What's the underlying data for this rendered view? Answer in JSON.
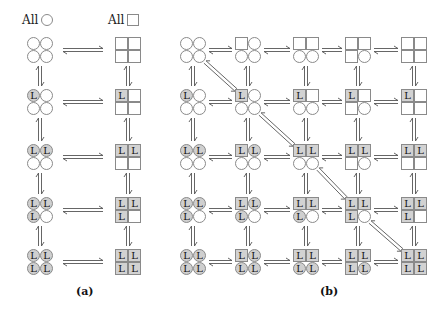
{
  "headers": {
    "circle": {
      "text": "All",
      "shape": "circle"
    },
    "square": {
      "text": "All",
      "shape": "square"
    }
  },
  "labels": {
    "a": "(a)",
    "b": "(b)"
  },
  "colors": {
    "stroke": "#8a8a8a",
    "filled": "#cfcfcf",
    "arrow": "#555555"
  },
  "panel_a": {
    "columns_x": [
      40,
      128
    ],
    "rows_y": [
      50,
      102,
      157,
      210,
      262
    ],
    "nodes": [
      {
        "col": 0,
        "row": 0,
        "cells": [
          [
            "c",
            ""
          ],
          [
            "c",
            ""
          ],
          [
            "c",
            ""
          ],
          [
            "c",
            ""
          ]
        ]
      },
      {
        "col": 0,
        "row": 1,
        "cells": [
          [
            "c",
            "L"
          ],
          [
            "c",
            ""
          ],
          [
            "c",
            ""
          ],
          [
            "c",
            ""
          ]
        ]
      },
      {
        "col": 0,
        "row": 2,
        "cells": [
          [
            "c",
            "L"
          ],
          [
            "c",
            "L"
          ],
          [
            "c",
            ""
          ],
          [
            "c",
            ""
          ]
        ]
      },
      {
        "col": 0,
        "row": 3,
        "cells": [
          [
            "c",
            "L"
          ],
          [
            "c",
            "L"
          ],
          [
            "c",
            "L"
          ],
          [
            "c",
            ""
          ]
        ]
      },
      {
        "col": 0,
        "row": 4,
        "cells": [
          [
            "c",
            "L"
          ],
          [
            "c",
            "L"
          ],
          [
            "c",
            "L"
          ],
          [
            "c",
            "L"
          ]
        ]
      },
      {
        "col": 1,
        "row": 0,
        "cells": [
          [
            "s",
            ""
          ],
          [
            "s",
            ""
          ],
          [
            "s",
            ""
          ],
          [
            "s",
            ""
          ]
        ]
      },
      {
        "col": 1,
        "row": 1,
        "cells": [
          [
            "s",
            "L"
          ],
          [
            "s",
            ""
          ],
          [
            "s",
            ""
          ],
          [
            "s",
            ""
          ]
        ]
      },
      {
        "col": 1,
        "row": 2,
        "cells": [
          [
            "s",
            "L"
          ],
          [
            "s",
            "L"
          ],
          [
            "s",
            ""
          ],
          [
            "s",
            ""
          ]
        ]
      },
      {
        "col": 1,
        "row": 3,
        "cells": [
          [
            "s",
            "L"
          ],
          [
            "s",
            "L"
          ],
          [
            "s",
            "L"
          ],
          [
            "s",
            ""
          ]
        ]
      },
      {
        "col": 1,
        "row": 4,
        "cells": [
          [
            "s",
            "L"
          ],
          [
            "s",
            "L"
          ],
          [
            "s",
            "L"
          ],
          [
            "s",
            "L"
          ]
        ]
      }
    ]
  },
  "panel_b": {
    "columns_x": [
      193,
      248,
      306,
      358,
      414
    ],
    "rows_y": [
      50,
      102,
      157,
      210,
      262
    ],
    "diagonals": [
      [
        0,
        0,
        1,
        1
      ],
      [
        1,
        1,
        2,
        2
      ],
      [
        2,
        2,
        3,
        3
      ],
      [
        3,
        3,
        4,
        4
      ]
    ],
    "nodes_note": "cells order: top-left, top-right, bottom-left, bottom-right; c=circle s=square; L=ligand bound"
  },
  "grid_b": [
    [
      [
        [
          "c",
          ""
        ],
        [
          "c",
          ""
        ],
        [
          "c",
          ""
        ],
        [
          "c",
          ""
        ]
      ],
      [
        [
          "s",
          ""
        ],
        [
          "c",
          ""
        ],
        [
          "c",
          ""
        ],
        [
          "c",
          ""
        ]
      ],
      [
        [
          "s",
          ""
        ],
        [
          "s",
          ""
        ],
        [
          "c",
          ""
        ],
        [
          "c",
          ""
        ]
      ],
      [
        [
          "s",
          ""
        ],
        [
          "s",
          ""
        ],
        [
          "s",
          ""
        ],
        [
          "c",
          ""
        ]
      ],
      [
        [
          "s",
          ""
        ],
        [
          "s",
          ""
        ],
        [
          "s",
          ""
        ],
        [
          "s",
          ""
        ]
      ]
    ],
    [
      [
        [
          "c",
          "L"
        ],
        [
          "c",
          ""
        ],
        [
          "c",
          ""
        ],
        [
          "c",
          ""
        ]
      ],
      [
        [
          "s",
          "L"
        ],
        [
          "c",
          ""
        ],
        [
          "c",
          ""
        ],
        [
          "c",
          ""
        ]
      ],
      [
        [
          "s",
          "L"
        ],
        [
          "s",
          ""
        ],
        [
          "c",
          ""
        ],
        [
          "c",
          ""
        ]
      ],
      [
        [
          "s",
          "L"
        ],
        [
          "s",
          ""
        ],
        [
          "s",
          ""
        ],
        [
          "c",
          ""
        ]
      ],
      [
        [
          "s",
          "L"
        ],
        [
          "s",
          ""
        ],
        [
          "s",
          ""
        ],
        [
          "s",
          ""
        ]
      ]
    ],
    [
      [
        [
          "c",
          "L"
        ],
        [
          "c",
          "L"
        ],
        [
          "c",
          ""
        ],
        [
          "c",
          ""
        ]
      ],
      [
        [
          "s",
          "L"
        ],
        [
          "c",
          "L"
        ],
        [
          "c",
          ""
        ],
        [
          "c",
          ""
        ]
      ],
      [
        [
          "s",
          "L"
        ],
        [
          "s",
          "L"
        ],
        [
          "c",
          ""
        ],
        [
          "c",
          ""
        ]
      ],
      [
        [
          "s",
          "L"
        ],
        [
          "s",
          "L"
        ],
        [
          "s",
          ""
        ],
        [
          "c",
          ""
        ]
      ],
      [
        [
          "s",
          "L"
        ],
        [
          "s",
          "L"
        ],
        [
          "s",
          ""
        ],
        [
          "s",
          ""
        ]
      ]
    ],
    [
      [
        [
          "c",
          "L"
        ],
        [
          "c",
          "L"
        ],
        [
          "c",
          "L"
        ],
        [
          "c",
          ""
        ]
      ],
      [
        [
          "s",
          "L"
        ],
        [
          "c",
          "L"
        ],
        [
          "c",
          "L"
        ],
        [
          "c",
          ""
        ]
      ],
      [
        [
          "s",
          "L"
        ],
        [
          "s",
          "L"
        ],
        [
          "c",
          "L"
        ],
        [
          "c",
          ""
        ]
      ],
      [
        [
          "s",
          "L"
        ],
        [
          "s",
          "L"
        ],
        [
          "s",
          "L"
        ],
        [
          "c",
          ""
        ]
      ],
      [
        [
          "s",
          "L"
        ],
        [
          "s",
          "L"
        ],
        [
          "s",
          "L"
        ],
        [
          "s",
          ""
        ]
      ]
    ],
    [
      [
        [
          "c",
          "L"
        ],
        [
          "c",
          "L"
        ],
        [
          "c",
          "L"
        ],
        [
          "c",
          "L"
        ]
      ],
      [
        [
          "s",
          "L"
        ],
        [
          "c",
          "L"
        ],
        [
          "c",
          "L"
        ],
        [
          "c",
          "L"
        ]
      ],
      [
        [
          "s",
          "L"
        ],
        [
          "s",
          "L"
        ],
        [
          "c",
          "L"
        ],
        [
          "c",
          "L"
        ]
      ],
      [
        [
          "s",
          "L"
        ],
        [
          "s",
          "L"
        ],
        [
          "s",
          "L"
        ],
        [
          "c",
          "L"
        ]
      ],
      [
        [
          "s",
          "L"
        ],
        [
          "s",
          "L"
        ],
        [
          "s",
          "L"
        ],
        [
          "s",
          "L"
        ]
      ]
    ]
  ]
}
